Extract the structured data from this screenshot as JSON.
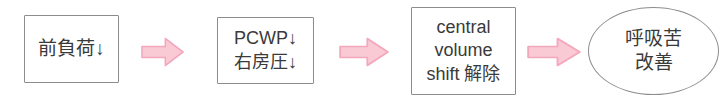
{
  "diagram": {
    "orientation": "left-to-right",
    "colors": {
      "node_border": "#8c8c8c",
      "node_fill": "#ffffff",
      "text": "#3a3a3a",
      "arrow_fill": "#f9c9d4",
      "arrow_stroke": "#f2a8bd"
    },
    "nodes": [
      {
        "id": "preload",
        "shape": "rectangle",
        "lines": [
          "前負荷↓"
        ]
      },
      {
        "id": "pcwp",
        "shape": "rectangle",
        "lines": [
          "PCWP↓",
          "右房圧↓"
        ]
      },
      {
        "id": "central",
        "shape": "rectangle",
        "lines": [
          "central",
          "volume",
          "shift 解除"
        ]
      },
      {
        "id": "outcome",
        "shape": "ellipse",
        "lines": [
          "呼吸苦",
          "改善"
        ]
      }
    ],
    "arrows": [
      {
        "id": "arrow-1",
        "from": "preload",
        "to": "pcwp",
        "icon": "right-arrow-icon"
      },
      {
        "id": "arrow-2",
        "from": "pcwp",
        "to": "central",
        "icon": "right-arrow-icon"
      },
      {
        "id": "arrow-3",
        "from": "central",
        "to": "outcome",
        "icon": "right-arrow-icon"
      }
    ]
  }
}
